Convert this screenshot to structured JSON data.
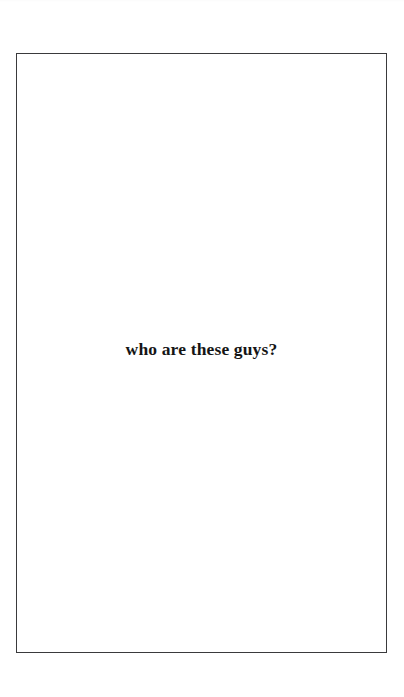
{
  "document": {
    "type": "scanned-book-page",
    "page_width": 404,
    "page_height": 697,
    "background_color": "#ffffff",
    "frame": {
      "name": "printed-rule-box",
      "border_color": "#3a3a3c",
      "border_width_px": 1,
      "left": 16,
      "top": 53,
      "width": 371,
      "height": 600
    },
    "content": {
      "section_title": "who are these guys?",
      "title_color": "#151515",
      "title_weight": "bold",
      "title_style": "serif",
      "title_font_size_px": 17.5,
      "title_alignment": "center",
      "title_vertical_position_pct": 49
    }
  }
}
